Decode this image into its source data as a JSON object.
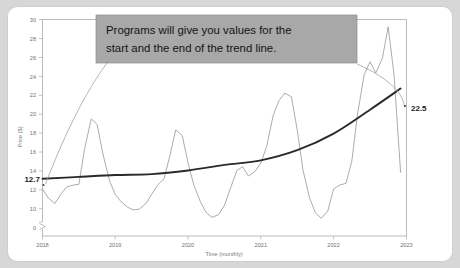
{
  "card": {
    "background": "#ffffff",
    "page_background": "#d7d7d7"
  },
  "callout": {
    "line1": "Programs will give you values for the",
    "line2": "start and the end of the trend line.",
    "background": "#a8a8a8",
    "text_color": "#131313"
  },
  "labels": {
    "trend_start": "12.7",
    "trend_end": "22.5"
  },
  "chart_data": {
    "type": "line",
    "title": "",
    "xlabel": "Time (monthly)",
    "ylabel": "Price ($)",
    "xlim": [
      2018,
      2023
    ],
    "ylim": [
      8,
      30
    ],
    "ylim_note": "axis broken between 0 and 8",
    "yticks": [
      8,
      10,
      12,
      14,
      16,
      18,
      20,
      22,
      24,
      26,
      28,
      30
    ],
    "ytick_labels": [
      "8",
      "10",
      "12",
      "14",
      "16",
      "18",
      "20",
      "22",
      "24",
      "26",
      "28",
      "30"
    ],
    "y_origin_label": "0",
    "axis_break": true,
    "xticks": [
      2018,
      2019,
      2020,
      2021,
      2022,
      2023
    ],
    "xtick_labels": [
      "2018",
      "2019",
      "2020",
      "2021",
      "2022",
      "2023"
    ],
    "grid": false,
    "legend": false,
    "series": [
      {
        "name": "Price (monthly)",
        "color": "#8d8f92",
        "type": "line",
        "x": [
          2018.0,
          2018.08,
          2018.17,
          2018.25,
          2018.33,
          2018.42,
          2018.5,
          2018.58,
          2018.67,
          2018.75,
          2018.83,
          2018.92,
          2019.0,
          2019.08,
          2019.17,
          2019.25,
          2019.33,
          2019.42,
          2019.5,
          2019.58,
          2019.67,
          2019.75,
          2019.83,
          2019.92,
          2020.0,
          2020.08,
          2020.17,
          2020.25,
          2020.33,
          2020.42,
          2020.5,
          2020.58,
          2020.67,
          2020.75,
          2020.83,
          2020.92,
          2021.0,
          2021.08,
          2021.17,
          2021.25,
          2021.33,
          2021.42,
          2021.5,
          2021.58,
          2021.67,
          2021.75,
          2021.83,
          2021.92,
          2022.0,
          2022.08,
          2022.17,
          2022.25,
          2022.33,
          2022.42,
          2022.5,
          2022.58,
          2022.67,
          2022.75,
          2022.83,
          2022.92
        ],
        "values": [
          11.6,
          10.6,
          10.0,
          11.0,
          11.8,
          12.0,
          12.1,
          16.0,
          19.2,
          18.6,
          15.4,
          12.5,
          11.0,
          10.2,
          9.6,
          9.3,
          9.4,
          10.0,
          11.0,
          12.0,
          12.7,
          15.2,
          18.0,
          17.4,
          14.4,
          12.0,
          10.2,
          9.0,
          8.5,
          8.8,
          9.8,
          11.6,
          13.6,
          14.0,
          13.0,
          13.5,
          14.4,
          16.2,
          19.6,
          21.2,
          22.0,
          21.6,
          18.0,
          13.6,
          10.6,
          9.0,
          8.4,
          9.2,
          11.6,
          12.0,
          12.2,
          14.6,
          19.8,
          24.0,
          25.4,
          24.2,
          25.8,
          29.2,
          24.0,
          13.4
        ]
      },
      {
        "name": "Trend line",
        "color": "#2a2a2a",
        "type": "line",
        "start_value": 12.7,
        "end_value": 22.5,
        "x": [
          2018.0,
          2018.5,
          2019.0,
          2019.5,
          2020.0,
          2020.5,
          2021.0,
          2021.5,
          2022.0,
          2022.5,
          2022.92
        ],
        "values": [
          12.7,
          12.9,
          13.1,
          13.2,
          13.6,
          14.2,
          14.7,
          15.8,
          17.6,
          20.2,
          22.5
        ]
      }
    ],
    "annotations": [
      {
        "text": "12.7",
        "x": 2018.0,
        "y": 12.7,
        "bold": true
      },
      {
        "text": "22.5",
        "x": 2022.92,
        "y": 22.5,
        "bold": true
      },
      {
        "text": "Programs will give you values for the start and the end of the trend line.",
        "type": "callout"
      }
    ]
  }
}
